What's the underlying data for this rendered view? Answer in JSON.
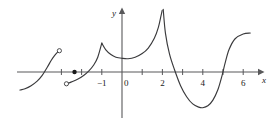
{
  "figure": {
    "name": "piecewise-function-graph",
    "axes": {
      "x_axis_label": "x",
      "y_axis_label": "y",
      "origin_label": "0",
      "x_ticks": [
        {
          "value": -3,
          "label": ""
        },
        {
          "value": -2,
          "label": ""
        },
        {
          "value": -1,
          "label": "−1"
        },
        {
          "value": 1,
          "label": ""
        },
        {
          "value": 2,
          "label": "2"
        },
        {
          "value": 3,
          "label": ""
        },
        {
          "value": 4,
          "label": "4"
        },
        {
          "value": 5,
          "label": ""
        },
        {
          "value": 6,
          "label": "6"
        }
      ],
      "x_range": [
        -5.2,
        7.0
      ],
      "y_range": [
        -2.1,
        3.4
      ],
      "grid": false,
      "stroke_color": "#58585a",
      "curve_color": "#3a3a3c"
    },
    "markers": [
      {
        "kind": "open-circle",
        "x": -3.1,
        "y": 1.12
      },
      {
        "kind": "filled-dot",
        "x": -2.35,
        "y": 0.0
      },
      {
        "kind": "open-circle",
        "x": -2.75,
        "y": -0.62
      }
    ],
    "features": {
      "cusp_x": -1,
      "vertical_asymptote_x": 2,
      "local_min_x": 4,
      "local_min_near_origin_x": 0.3
    }
  },
  "chart_data": {
    "type": "line",
    "title": "",
    "xlabel": "x",
    "ylabel": "y",
    "xlim": [
      -5.2,
      7.0
    ],
    "ylim": [
      -2.1,
      3.4
    ],
    "grid": false,
    "xticks": [
      -1,
      2,
      4,
      6
    ],
    "xticklabels": [
      "−1",
      "2",
      "4",
      "6"
    ],
    "series": [
      {
        "name": "branch-1",
        "comment": "left S-shaped branch ending at open circle",
        "x": [
          -5.05,
          -4.8,
          -4.5,
          -4.2,
          -3.95,
          -3.7,
          -3.5,
          -3.35,
          -3.2,
          -3.1
        ],
        "y": [
          -0.95,
          -0.88,
          -0.72,
          -0.48,
          -0.18,
          0.25,
          0.62,
          0.85,
          1.03,
          1.12
        ]
      },
      {
        "name": "branch-2",
        "comment": "rising branch from open circle up to cusp at x = -1",
        "x": [
          -2.75,
          -2.5,
          -2.2,
          -1.9,
          -1.65,
          -1.4,
          -1.2,
          -1.0
        ],
        "y": [
          -0.62,
          -0.52,
          -0.38,
          -0.18,
          0.05,
          0.37,
          0.78,
          1.52
        ]
      },
      {
        "name": "branch-3",
        "comment": "from cusp down to local minimum then up to asymptote at x = 2",
        "x": [
          -1.0,
          -0.8,
          -0.55,
          -0.3,
          0.0,
          0.3,
          0.65,
          1.0,
          1.3,
          1.6,
          1.8,
          1.93,
          1.99
        ],
        "y": [
          1.52,
          1.17,
          0.92,
          0.78,
          0.72,
          0.7,
          0.78,
          0.97,
          1.26,
          1.77,
          2.35,
          2.95,
          3.25
        ]
      },
      {
        "name": "branch-4",
        "comment": "right of asymptote: steep drop through x-axis, min near x = 4, steep rise through x = 5",
        "x": [
          2.04,
          2.15,
          2.35,
          2.6,
          2.9,
          3.2,
          3.5,
          3.8,
          4.0,
          4.25,
          4.5,
          4.75,
          4.95,
          5.1,
          5.3,
          5.6,
          6.0,
          6.35
        ],
        "y": [
          3.3,
          2.05,
          0.95,
          0.12,
          -0.72,
          -1.3,
          -1.68,
          -1.85,
          -1.88,
          -1.78,
          -1.48,
          -0.92,
          -0.2,
          0.45,
          1.18,
          1.75,
          2.0,
          2.05
        ]
      }
    ]
  }
}
